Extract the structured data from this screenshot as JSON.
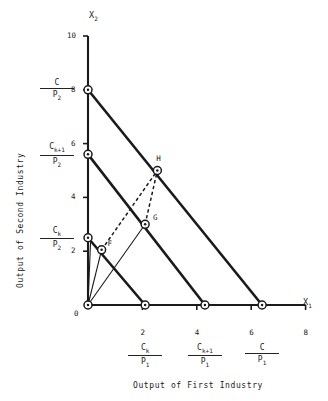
{
  "figure": {
    "axis_titles": {
      "x_symbol": "X",
      "x_symbol_sub": "1",
      "y_symbol": "X",
      "y_symbol_sub": "2",
      "x_caption": "Output of First Industry",
      "y_caption": "Output of Second Industry"
    },
    "origin_label": "0",
    "x_ticks": [
      {
        "value": 0,
        "label": ""
      },
      {
        "value": 2,
        "label": "2"
      },
      {
        "value": 4,
        "label": "4"
      },
      {
        "value": 6,
        "label": "6"
      },
      {
        "value": 8,
        "label": "8"
      }
    ],
    "y_ticks": [
      {
        "value": 0,
        "label": ""
      },
      {
        "value": 2,
        "label": "2"
      },
      {
        "value": 4,
        "label": "4"
      },
      {
        "value": 6,
        "label": "6"
      },
      {
        "value": 8,
        "label": "8"
      },
      {
        "value": 10,
        "label": "10"
      }
    ],
    "y_fraction_labels": [
      {
        "numerator": "C",
        "numerator_sub": "",
        "denominator": "P",
        "denominator_sub": "2",
        "at_value": 8
      },
      {
        "numerator": "C",
        "numerator_sub": "k+1",
        "denominator": "P",
        "denominator_sub": "2",
        "at_value": 5.6
      },
      {
        "numerator": "C",
        "numerator_sub": "k",
        "denominator": "P",
        "denominator_sub": "2",
        "at_value": 2.5
      }
    ],
    "x_fraction_labels": [
      {
        "numerator": "C",
        "numerator_sub": "k",
        "denominator": "P",
        "denominator_sub": "1",
        "at_value": 2.1
      },
      {
        "numerator": "C",
        "numerator_sub": "k+1",
        "denominator": "P",
        "denominator_sub": "1",
        "at_value": 4.3
      },
      {
        "numerator": "C",
        "numerator_sub": "",
        "denominator": "P",
        "denominator_sub": "1",
        "at_value": 6.4
      }
    ],
    "point_labels": [
      {
        "name": "F",
        "x": 0.5,
        "y": 2.05
      },
      {
        "name": "G",
        "x": 2.1,
        "y": 3.0
      },
      {
        "name": "H",
        "x": 2.55,
        "y": 5.0
      }
    ]
  },
  "chart_data": {
    "type": "line",
    "title": "",
    "xlabel": "Output of First Industry",
    "ylabel": "Output of Second Industry",
    "xlim": [
      0,
      8
    ],
    "ylim": [
      0,
      10
    ],
    "grid": false,
    "legend": "none",
    "series": [
      {
        "name": "budget-line-C",
        "style": "solid-thick",
        "points": [
          {
            "x": 0,
            "y": 8
          },
          {
            "x": 6.4,
            "y": 0
          }
        ]
      },
      {
        "name": "budget-line-C-k-plus-1",
        "style": "solid-thick",
        "points": [
          {
            "x": 0,
            "y": 5.6
          },
          {
            "x": 4.3,
            "y": 0
          }
        ]
      },
      {
        "name": "budget-line-C-k",
        "style": "solid-thick",
        "points": [
          {
            "x": 0,
            "y": 2.5
          },
          {
            "x": 2.1,
            "y": 0
          }
        ]
      },
      {
        "name": "ray-origin-to-G",
        "style": "solid-thin",
        "points": [
          {
            "x": 0,
            "y": 0
          },
          {
            "x": 2.1,
            "y": 3.0
          }
        ]
      },
      {
        "name": "ray-origin-to-F",
        "style": "solid-thin",
        "points": [
          {
            "x": 0,
            "y": 0
          },
          {
            "x": 0.5,
            "y": 2.05
          }
        ]
      },
      {
        "name": "ray-origin-to-Ck-P2",
        "style": "solid-thin",
        "points": [
          {
            "x": 0,
            "y": 0
          },
          {
            "x": 0.1,
            "y": 2.5
          }
        ]
      },
      {
        "name": "dashed-F-to-H",
        "style": "dashed",
        "points": [
          {
            "x": 0.5,
            "y": 2.05
          },
          {
            "x": 2.55,
            "y": 5.0
          }
        ]
      },
      {
        "name": "dashed-G-to-H",
        "style": "dashed",
        "points": [
          {
            "x": 2.1,
            "y": 3.0
          },
          {
            "x": 2.55,
            "y": 5.0
          }
        ]
      }
    ],
    "markers": [
      {
        "label": "",
        "x": 0,
        "y": 8
      },
      {
        "label": "",
        "x": 0,
        "y": 5.6
      },
      {
        "label": "",
        "x": 0,
        "y": 2.5
      },
      {
        "label": "F",
        "x": 0.5,
        "y": 2.05
      },
      {
        "label": "G",
        "x": 2.1,
        "y": 3.0
      },
      {
        "label": "H",
        "x": 2.55,
        "y": 5.0
      },
      {
        "label": "",
        "x": 0,
        "y": 0
      },
      {
        "label": "",
        "x": 2.1,
        "y": 0
      },
      {
        "label": "",
        "x": 4.3,
        "y": 0
      },
      {
        "label": "",
        "x": 6.4,
        "y": 0
      }
    ]
  },
  "colors": {
    "ink": "#1a1a1a",
    "background": "#ffffff"
  }
}
